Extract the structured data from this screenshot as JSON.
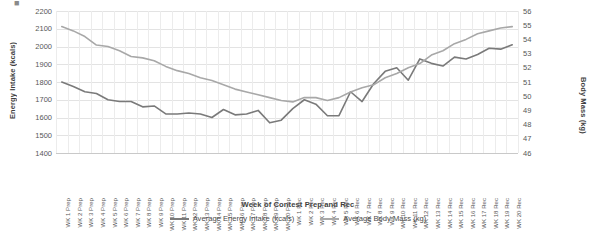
{
  "chart_data": {
    "type": "line",
    "title": "",
    "xlabel": "Week of Contest Prep and Rec",
    "ylabel": "Energy Intake (kcals)",
    "y2label": "Body Mass (kg)",
    "ylim": [
      1400,
      2200
    ],
    "y2lim": [
      46,
      56
    ],
    "yticks": [
      2200,
      2100,
      2000,
      1900,
      1800,
      1700,
      1600,
      1500,
      1400
    ],
    "y2ticks": [
      56,
      55,
      54,
      53,
      52,
      51,
      50,
      49,
      48,
      47,
      46
    ],
    "grid": true,
    "legend_position": "bottom",
    "categories": [
      "WK 1 Prep",
      "WK 2 Prep",
      "WK 3 Prep",
      "WK 4 Prep",
      "WK 5 Prep",
      "WK 6 Prep",
      "WK 7 Prep",
      "WK 8 Prep",
      "WK 9 Prep",
      "WK 10 Prep",
      "WK 11 Prep",
      "WK 12 Prep",
      "WK 13 Prep",
      "WK 14 Prep",
      "WK 15 Prep",
      "WK 16 Prep",
      "WK 17 Prep",
      "WK 18 Prep",
      "WK 19 Prep",
      "WK 20 Prep",
      "WK 1 Rec",
      "WK 2 Rec",
      "WK 3 Rec",
      "WK 4 Rec",
      "WK 5 Rec",
      "WK 6 Rec",
      "WK 7 Rec",
      "WK 8 Rec",
      "WK 9 Rec",
      "WK 10 Rec",
      "WK 11 Rec",
      "WK 12 Rec",
      "WK 13 Rec",
      "WK 14 Rec",
      "WK 15 Rec",
      "WK 16 Rec",
      "WK 17 Rec",
      "WK 18 Rec",
      "WK 19 Rec",
      "WK 20 Rec"
    ],
    "series": [
      {
        "name": "Average Energy Intake (kcals)",
        "axis": "left",
        "color": "#7a7a7a",
        "values": [
          1800,
          1775,
          1745,
          1735,
          1700,
          1690,
          1690,
          1660,
          1665,
          1620,
          1620,
          1625,
          1620,
          1600,
          1645,
          1615,
          1620,
          1640,
          1570,
          1585,
          1650,
          1700,
          1675,
          1610,
          1610,
          1745,
          1690,
          1790,
          1860,
          1880,
          1810,
          1930,
          1905,
          1890,
          1940,
          1930,
          1955,
          1990,
          1985,
          2010
        ]
      },
      {
        "name": "Average Body Mass (kg)",
        "axis": "right",
        "color": "#a8a8a8",
        "values": [
          54.9,
          54.6,
          54.2,
          53.6,
          53.5,
          53.2,
          52.8,
          52.7,
          52.5,
          52.1,
          51.8,
          51.6,
          51.3,
          51.1,
          50.8,
          50.5,
          50.3,
          50.1,
          49.9,
          49.7,
          49.6,
          49.9,
          49.9,
          49.7,
          49.9,
          50.3,
          50.6,
          50.8,
          51.3,
          51.6,
          52.0,
          52.3,
          52.9,
          53.2,
          53.7,
          54.0,
          54.4,
          54.6,
          54.8,
          54.9
        ]
      }
    ]
  },
  "legend": {
    "items": [
      {
        "label": "Average Energy Intake (kcals)"
      },
      {
        "label": "Average Body Mass (kg)"
      }
    ]
  },
  "corner": {
    "glyph": "■"
  }
}
